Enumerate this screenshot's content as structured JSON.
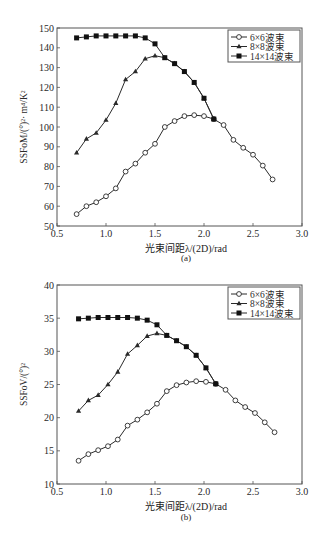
{
  "chart_data": [
    {
      "id": "a",
      "type": "line",
      "title": "",
      "caption": "(a)",
      "xlabel": "光束间距λ/(2D)/rad",
      "ylabel": "SSFoM/(°)²· m⁴/K²",
      "xlim": [
        0.5,
        3.0
      ],
      "ylim": [
        50,
        150
      ],
      "xticks": [
        "0.5",
        "1.0",
        "1.5",
        "2.0",
        "2.5",
        "3.0"
      ],
      "yticks": [
        "50",
        "60",
        "70",
        "80",
        "90",
        "100",
        "110",
        "120",
        "130",
        "140",
        "150"
      ],
      "grid": false,
      "legend_position": "upper right",
      "series": [
        {
          "name": "6×6波束",
          "marker": "open-circle",
          "x": [
            0.7,
            0.8,
            0.9,
            1.0,
            1.1,
            1.2,
            1.3,
            1.4,
            1.5,
            1.6,
            1.7,
            1.8,
            1.9,
            2.0,
            2.1,
            2.2,
            2.3,
            2.4,
            2.5,
            2.6,
            2.7
          ],
          "values": [
            56,
            60,
            62,
            65,
            69,
            77.5,
            81.5,
            87,
            91.5,
            100,
            103,
            105.5,
            106,
            105.5,
            104,
            101,
            93.5,
            89.5,
            86,
            80.5,
            73.5
          ]
        },
        {
          "name": "8×8波束",
          "marker": "filled-triangle",
          "x": [
            0.7,
            0.8,
            0.9,
            1.0,
            1.1,
            1.2,
            1.3,
            1.4,
            1.5,
            1.6,
            1.7,
            1.8,
            1.9,
            2.0,
            2.1
          ],
          "values": [
            87,
            94,
            97,
            103.5,
            112,
            124,
            128,
            134.5,
            136,
            135,
            132,
            128,
            122.5,
            114.5,
            104
          ]
        },
        {
          "name": "14×14波束",
          "marker": "filled-square",
          "x": [
            0.7,
            0.8,
            0.9,
            1.0,
            1.1,
            1.2,
            1.3,
            1.4,
            1.5,
            1.6,
            1.7,
            1.8,
            1.9,
            2.0,
            2.1
          ],
          "values": [
            145,
            145.5,
            146,
            146,
            146,
            146,
            146,
            145,
            142,
            135,
            132,
            128,
            122.5,
            114.5,
            104
          ]
        }
      ]
    },
    {
      "id": "b",
      "type": "line",
      "title": "",
      "caption": "(b)",
      "xlabel": "光束间距λ/(2D)/rad",
      "ylabel": "SSFoV/(°)²",
      "xlim": [
        0.5,
        3.0
      ],
      "ylim": [
        10,
        40
      ],
      "xticks": [
        "0.5",
        "1.0",
        "1.5",
        "2.0",
        "2.5",
        "3.0"
      ],
      "yticks": [
        "10",
        "15",
        "20",
        "25",
        "30",
        "35",
        "40"
      ],
      "grid": false,
      "legend_position": "upper right",
      "series": [
        {
          "name": "6×6波束",
          "marker": "open-circle",
          "x": [
            0.72,
            0.82,
            0.92,
            1.02,
            1.12,
            1.22,
            1.32,
            1.42,
            1.52,
            1.62,
            1.72,
            1.82,
            1.92,
            2.02,
            2.12,
            2.22,
            2.32,
            2.42,
            2.52,
            2.62,
            2.72
          ],
          "values": [
            13.5,
            14.5,
            15.1,
            15.7,
            16.7,
            18.8,
            19.7,
            20.8,
            22.1,
            24.0,
            24.9,
            25.3,
            25.5,
            25.4,
            25.1,
            24.2,
            22.6,
            21.6,
            20.7,
            19.3,
            17.8
          ]
        },
        {
          "name": "8×8波束",
          "marker": "filled-triangle",
          "x": [
            0.72,
            0.82,
            0.92,
            1.02,
            1.12,
            1.22,
            1.32,
            1.42,
            1.52,
            1.62,
            1.72,
            1.82,
            1.92,
            2.02,
            2.12
          ],
          "values": [
            21.0,
            22.6,
            23.4,
            25.0,
            26.9,
            29.6,
            30.9,
            32.3,
            32.7,
            32.4,
            31.6,
            30.7,
            29.4,
            27.5,
            25.1
          ]
        },
        {
          "name": "14×14波束",
          "marker": "filled-square",
          "x": [
            0.72,
            0.82,
            0.92,
            1.02,
            1.12,
            1.22,
            1.32,
            1.42,
            1.52,
            1.62,
            1.72,
            1.82,
            1.92,
            2.02,
            2.12
          ],
          "values": [
            34.9,
            35.0,
            35.1,
            35.1,
            35.1,
            35.1,
            35.0,
            34.7,
            34.0,
            32.4,
            31.6,
            30.7,
            29.4,
            27.5,
            25.1
          ]
        }
      ]
    }
  ]
}
